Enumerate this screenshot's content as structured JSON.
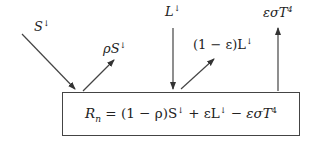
{
  "diagram": {
    "type": "energy-balance",
    "incoming_shortwave": {
      "symbol": "S",
      "arrow_glyph": "↓"
    },
    "reflected_shortwave": {
      "prefix": "ρ",
      "symbol": "S",
      "arrow_glyph": "↓"
    },
    "incoming_longwave": {
      "symbol": "L",
      "arrow_glyph": "↓"
    },
    "reflected_longwave": {
      "prefix": "(1 − ε)",
      "symbol": "L",
      "arrow_glyph": "↓"
    },
    "emitted_longwave": {
      "text": "εσT",
      "exp": "4"
    },
    "equation": {
      "lhs": "R",
      "lhs_sub": "n",
      "part1": " = (1 − ρ)S",
      "arrow1": "↓",
      "part2": " + εL",
      "arrow2": "↓",
      "part3": " − εσT",
      "exp": "4"
    },
    "colors": {
      "stroke": "#444444",
      "text": "#222222"
    }
  }
}
